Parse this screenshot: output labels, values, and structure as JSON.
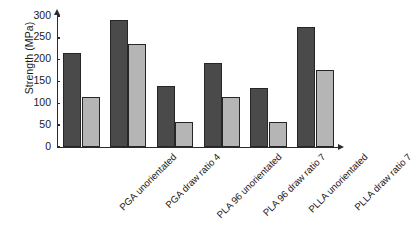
{
  "chart_data": {
    "type": "bar",
    "title": "",
    "subtitle": "",
    "xlabel": "",
    "ylabel": "Strength (MPa)",
    "ylim": [
      0,
      300
    ],
    "yticks": [
      0,
      50,
      100,
      150,
      200,
      250,
      300
    ],
    "ytick_labels": [
      "0",
      "50",
      "100",
      "150",
      "200",
      "250",
      "300"
    ],
    "grid": false,
    "legend": "none",
    "categories": [
      "PGA unorientated",
      "PGA draw ratio 4",
      "PLA 96 unorientated",
      "PLA 96 draw ratio 7",
      "PLLA unorientated",
      "PLLA draw ratio 7"
    ],
    "series": [
      {
        "name": "series-dark",
        "color": "#4a4a4a",
        "values": [
          215,
          290,
          139,
          192,
          135,
          275
        ]
      },
      {
        "name": "series-light",
        "color": "#b5b5b5",
        "values": [
          115,
          235,
          57,
          115,
          57,
          177
        ]
      }
    ],
    "axis_color": "#2b2b2b",
    "bar_edge_color": "#262626",
    "background": "#ffffff",
    "x_label_rotation": -45
  }
}
